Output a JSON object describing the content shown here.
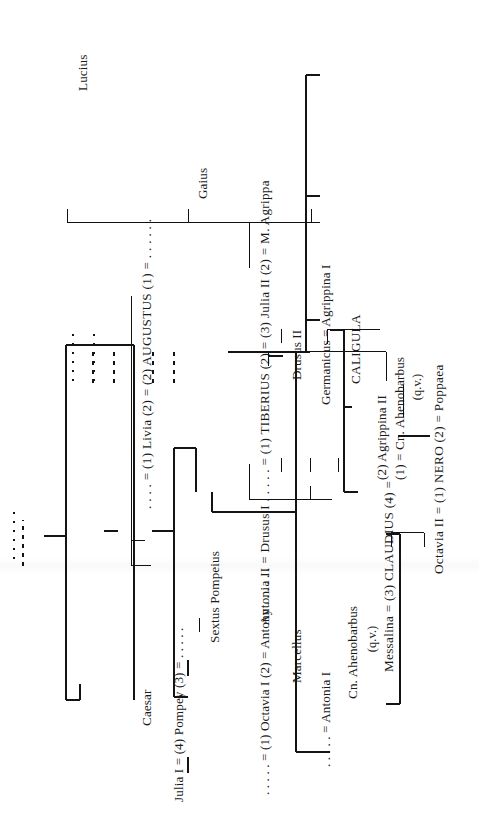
{
  "document": {
    "title": "Genealogical table of the Julio-Claudian house",
    "orientation": "rotated-90-ccw",
    "ink_color": "#141414",
    "paper_color": "#ffffff"
  },
  "nodes": {
    "caesar": "Caesar",
    "julia_pompey": "Julia I = (4) Pompey (3) = . . . . .",
    "sextus_pompeius": "Sextus Pompeius",
    "octavia_antony": ". . . . . = (1) Octavia I (2) = Antony  . . . . . .",
    "marcellus": "Marcellus",
    "antonia_i": ". . . . . = Antonia I",
    "cn_ahenobarbus_left": "Cn. Ahenobarbus",
    "cn_ahenobarbus_left_qv": "(q.v.)",
    "livia_augustus": ". . . . = (1) Livia (2) = (2) AUGUSTUS (1) = . . . . . .",
    "antonia_ii_drusus": "Antonia II = Drusus I . . . . . = (1) TIBERIUS (2) = (3) Julia II (2) = M. Agrippa",
    "drusus_ii": "Drusus II",
    "germanicus_agrippina": "Germanicus = Agrippina I",
    "agrippina_i": "Agrippina I",
    "gaius": "Gaius",
    "lucius": "Lucius",
    "caligula": "CALIGULA",
    "messalina_claudius": "Messalina = (3) CLAUDIUS (4) =",
    "agrippina_ii": "(2) Agrippina II",
    "ahenobarbus_right": "(1) = Cn. Ahenobarbus",
    "ahenobarbus_right_qv": "(q.v.)",
    "octavia_nero": "Octavia II = (1) NERO (2) = Poppaea"
  }
}
